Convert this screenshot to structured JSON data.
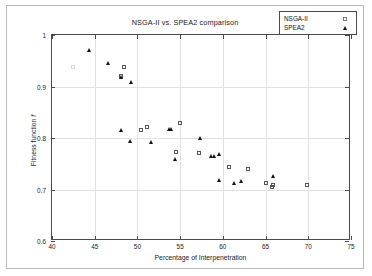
{
  "figure": {
    "title": "NSGA-II vs. SPEA2 comparison",
    "xlabel": "Percentage of Interpenetration",
    "ylabel_prefix": "Fitness function ",
    "ylabel_symbol": "f"
  },
  "legend": {
    "position": "top-right",
    "entries": [
      {
        "label": "NSGA-II",
        "marker": "open-square",
        "color": "#555555"
      },
      {
        "label": "SPEA2",
        "marker": "filled-triangle",
        "color": "#121212"
      }
    ]
  },
  "axis": {
    "xticks": [
      40,
      45,
      50,
      55,
      60,
      65,
      70,
      75
    ],
    "yticks": [
      "0.6",
      "0.7",
      "0.8",
      "0.9",
      "1"
    ]
  },
  "chart_data": {
    "type": "scatter",
    "title": "NSGA-II vs. SPEA2 comparison",
    "xlabel": "Percentage of Interpenetration",
    "ylabel": "Fitness function f",
    "xlim": [
      40,
      75
    ],
    "ylim": [
      0.6,
      1.0
    ],
    "xticks": [
      40,
      45,
      50,
      55,
      60,
      65,
      70,
      75
    ],
    "yticks": [
      0.6,
      0.7,
      0.8,
      0.9,
      1.0
    ],
    "grid": true,
    "legend_position": "upper right",
    "series": [
      {
        "name": "NSGA-II",
        "marker": "open-square",
        "color": "#555555",
        "points": [
          [
            42.5,
            0.937
          ],
          [
            48.1,
            0.921
          ],
          [
            48.4,
            0.937
          ],
          [
            50.4,
            0.816
          ],
          [
            51.1,
            0.822
          ],
          [
            54.5,
            0.773
          ],
          [
            55.0,
            0.829
          ],
          [
            57.2,
            0.77
          ],
          [
            60.7,
            0.744
          ],
          [
            62.9,
            0.74
          ],
          [
            65.0,
            0.712
          ],
          [
            65.7,
            0.705
          ],
          [
            65.9,
            0.708
          ],
          [
            69.8,
            0.709
          ]
        ]
      },
      {
        "name": "SPEA2",
        "marker": "filled-triangle",
        "color": "#121212",
        "points": [
          [
            44.3,
            0.97
          ],
          [
            46.6,
            0.946
          ],
          [
            48.1,
            0.919
          ],
          [
            48.1,
            0.815
          ],
          [
            49.2,
            0.908
          ],
          [
            49.1,
            0.794
          ],
          [
            51.6,
            0.793
          ],
          [
            53.7,
            0.817
          ],
          [
            53.9,
            0.818
          ],
          [
            54.4,
            0.76
          ],
          [
            57.3,
            0.8
          ],
          [
            58.6,
            0.765
          ],
          [
            59.0,
            0.765
          ],
          [
            59.6,
            0.769
          ],
          [
            59.6,
            0.719
          ],
          [
            61.3,
            0.712
          ],
          [
            62.1,
            0.717
          ],
          [
            65.9,
            0.727
          ]
        ]
      }
    ]
  }
}
